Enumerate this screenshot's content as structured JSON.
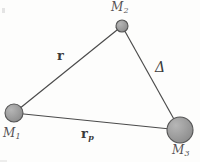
{
  "figure": {
    "caption": "",
    "background_color": "#fdfdfc",
    "line_color": "#4a4a4a",
    "body_fill_color": "#9a9a9a",
    "body_stroke_color": "#555555",
    "label_color": "#555153"
  },
  "bodies": [
    {
      "id": "m1",
      "label": "M",
      "subscript": "1",
      "cx": 14,
      "cy": 113,
      "r": 9,
      "label_x": 3,
      "label_y": 127
    },
    {
      "id": "m2",
      "label": "M",
      "subscript": "2",
      "cx": 122,
      "cy": 26,
      "r": 6,
      "label_x": 111,
      "label_y": 1
    },
    {
      "id": "m3",
      "label": "M",
      "subscript": "3",
      "cx": 180,
      "cy": 130,
      "r": 13,
      "label_x": 172,
      "label_y": 144
    }
  ],
  "vectors": [
    {
      "id": "r",
      "label": "r",
      "subscript": "",
      "from": "m1",
      "to": "m2",
      "label_x": 57,
      "label_y": 49,
      "style": "bold"
    },
    {
      "id": "delta",
      "label": "Δ",
      "subscript": "",
      "from": "m2",
      "to": "m3",
      "label_x": 155,
      "label_y": 60,
      "style": "italic"
    },
    {
      "id": "rp",
      "label": "r",
      "subscript": "p",
      "from": "m1",
      "to": "m3",
      "label_x": 81,
      "label_y": 127,
      "style": "bold"
    }
  ],
  "geometry": {
    "width": 200,
    "height": 162,
    "r_line": {
      "x1": 14,
      "y1": 113,
      "x2": 122,
      "y2": 26
    },
    "delta_line": {
      "x1": 122,
      "y1": 26,
      "x2": 180,
      "y2": 130
    },
    "rp_line": {
      "x1": 14,
      "y1": 113,
      "x2": 180,
      "y2": 130
    }
  }
}
